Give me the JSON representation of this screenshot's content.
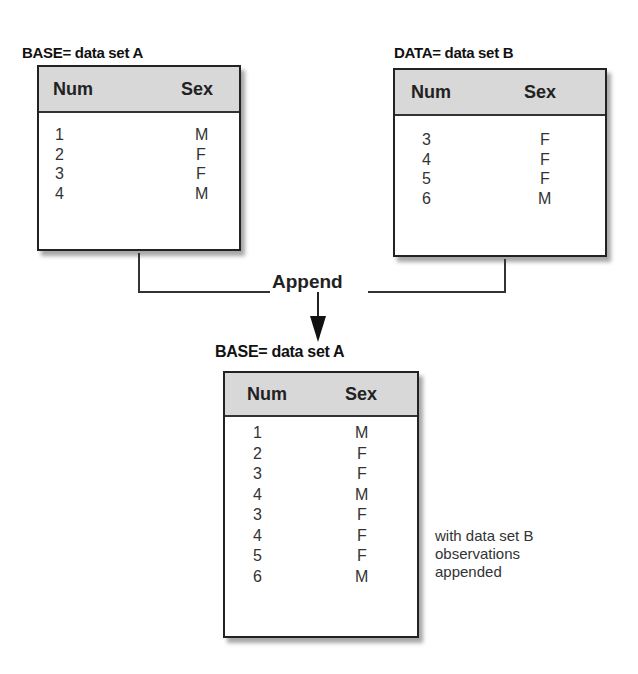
{
  "diagram": {
    "title_base_top": "BASE= data set A",
    "title_data_top": "DATA= data set B",
    "operation_label": "Append",
    "title_result": "BASE=  data set A",
    "note_lines": [
      "with data set B",
      "observations",
      "appended"
    ],
    "tables": {
      "base": {
        "columns": [
          "Num",
          "Sex"
        ],
        "rows": [
          {
            "num": "1",
            "sex": "M"
          },
          {
            "num": "2",
            "sex": "F"
          },
          {
            "num": "3",
            "sex": "F"
          },
          {
            "num": "4",
            "sex": "M"
          }
        ]
      },
      "data": {
        "columns": [
          "Num",
          "Sex"
        ],
        "rows": [
          {
            "num": "3",
            "sex": "F"
          },
          {
            "num": "4",
            "sex": "F"
          },
          {
            "num": "5",
            "sex": "F"
          },
          {
            "num": "6",
            "sex": "M"
          }
        ]
      },
      "result": {
        "columns": [
          "Num",
          "Sex"
        ],
        "rows": [
          {
            "num": "1",
            "sex": "M"
          },
          {
            "num": "2",
            "sex": "F"
          },
          {
            "num": "3",
            "sex": "F"
          },
          {
            "num": "4",
            "sex": "M"
          },
          {
            "num": "3",
            "sex": "F"
          },
          {
            "num": "4",
            "sex": "F"
          },
          {
            "num": "5",
            "sex": "F"
          },
          {
            "num": "6",
            "sex": "M"
          }
        ]
      }
    },
    "colors": {
      "header_bg": "#d8d8d8",
      "border": "#222222",
      "connector": "#333333"
    }
  }
}
